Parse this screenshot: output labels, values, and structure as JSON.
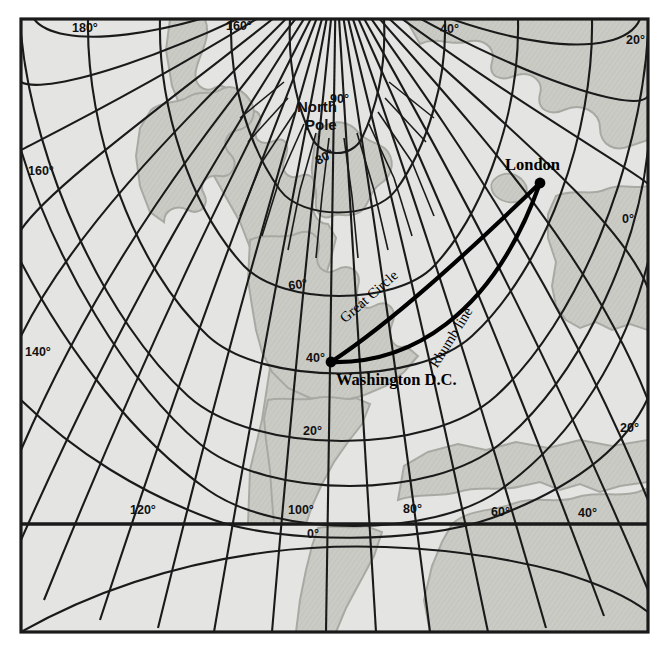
{
  "figure": {
    "kind": "map",
    "projection_note": "polar-centred graticule map",
    "background_color": "#ffffff",
    "ocean_color": "#e4e4e2",
    "land_color": "#c9c9c5",
    "coast_color": "#a9a9a4",
    "line_color": "#1a1a1a",
    "border_color": "#1a1a1a",
    "route_color": "#000000"
  },
  "pole": {
    "label_line1": "North",
    "label_line2": "Pole"
  },
  "latitude_labels": [
    {
      "text": "80°",
      "x": 318,
      "y": 165,
      "rotate": -28
    },
    {
      "text": "60°",
      "x": 289,
      "y": 290,
      "rotate": -8
    },
    {
      "text": "40°",
      "x": 306,
      "y": 362,
      "rotate": 0
    },
    {
      "text": "20°",
      "x": 303,
      "y": 435,
      "rotate": 0
    }
  ],
  "longitude_labels": [
    {
      "text": "180°",
      "x": 72,
      "y": 32,
      "rotate": 0
    },
    {
      "text": "160°",
      "x": 226,
      "y": 30,
      "rotate": 0
    },
    {
      "text": "40°",
      "x": 440,
      "y": 33,
      "rotate": 0
    },
    {
      "text": "20°",
      "x": 626,
      "y": 44,
      "rotate": 0
    },
    {
      "text": "90°",
      "x": 330,
      "y": 103,
      "rotate": 0
    },
    {
      "text": "160°",
      "x": 28,
      "y": 175,
      "rotate": 0
    },
    {
      "text": "0°",
      "x": 622,
      "y": 223,
      "rotate": 0
    },
    {
      "text": "140°",
      "x": 25,
      "y": 356,
      "rotate": 0
    },
    {
      "text": "20°",
      "x": 620,
      "y": 432,
      "rotate": 0
    },
    {
      "text": "120°",
      "x": 130,
      "y": 514,
      "rotate": 0
    },
    {
      "text": "100°",
      "x": 288,
      "y": 514,
      "rotate": 0
    },
    {
      "text": "80°",
      "x": 403,
      "y": 513,
      "rotate": 0
    },
    {
      "text": "60°",
      "x": 491,
      "y": 516,
      "rotate": 0
    },
    {
      "text": "40°",
      "x": 578,
      "y": 517,
      "rotate": 0
    },
    {
      "text": "0°",
      "x": 307,
      "y": 538,
      "rotate": 0
    }
  ],
  "cities": [
    {
      "name": "London",
      "label": "London",
      "dot_x": 540,
      "dot_y": 183,
      "label_x": 505,
      "label_y": 170
    },
    {
      "name": "Washington D.C.",
      "label": "Washington D.C.",
      "dot_x": 331,
      "dot_y": 362,
      "label_x": 336,
      "label_y": 385
    }
  ],
  "routes": [
    {
      "name": "great-circle",
      "label": "Great Circle",
      "label_x": 372,
      "label_y": 300,
      "label_rotate": -41
    },
    {
      "name": "rhumb-line",
      "label": "Rhumb line",
      "label_x": 455,
      "label_y": 340,
      "label_rotate": -58
    }
  ]
}
